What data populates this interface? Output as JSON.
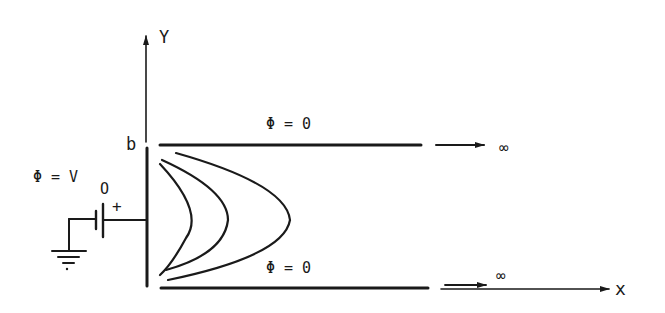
{
  "diagram": {
    "axes": {
      "y_label": "Y",
      "x_label": "x",
      "plate_height_label": "b"
    },
    "left_plate": {
      "potential_label": "Φ = V",
      "potential_subscript": "O",
      "polarity_label": "+"
    },
    "top_plate": {
      "potential_label": "Φ = 0",
      "extends_to_label": "∞"
    },
    "bottom_plate": {
      "potential_label": "Φ = 0",
      "extends_to_label": "∞"
    },
    "equipotential_curve_count": 3,
    "components": [
      "battery",
      "ground"
    ],
    "colors": {
      "ink": "#1a1a1a",
      "background": "#ffffff"
    }
  }
}
